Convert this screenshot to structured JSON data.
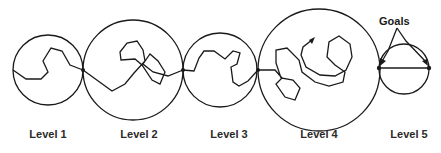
{
  "diagram": {
    "stroke_color": "#1a1a1a",
    "levels": [
      {
        "label": "Level 1",
        "cx": 48,
        "cy": 70,
        "r": 35,
        "label_x": 48
      },
      {
        "label": "Level 2",
        "cx": 133,
        "cy": 70,
        "r": 50,
        "label_x": 139
      },
      {
        "label": "Level 3",
        "cx": 220,
        "cy": 70,
        "r": 37,
        "label_x": 229
      },
      {
        "label": "Level 4",
        "cx": 319,
        "cy": 70,
        "r": 61,
        "label_x": 319
      },
      {
        "label": "Level 5",
        "cx": 404,
        "cy": 69,
        "r": 25,
        "label_x": 409
      }
    ],
    "goals_label": "Goals",
    "connection_points": [
      [
        83,
        70
      ],
      [
        183,
        70
      ],
      [
        258,
        70
      ],
      [
        379,
        68
      ],
      [
        429,
        68
      ]
    ]
  }
}
